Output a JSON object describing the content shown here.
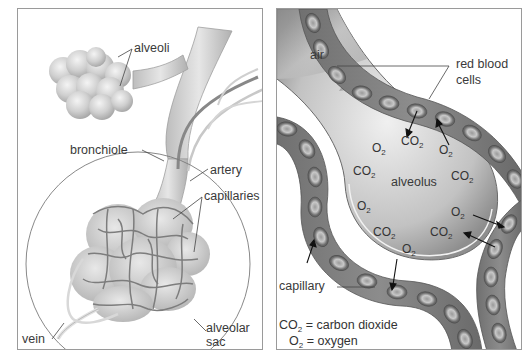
{
  "left_panel": {
    "labels": {
      "alveoli": "alveoli",
      "bronchiole": "bronchiole",
      "artery": "artery",
      "capillaries": "capillaries",
      "vein": "vein",
      "alveolar_sac_1": "alveolar",
      "alveolar_sac_2": "sac"
    }
  },
  "right_panel": {
    "labels": {
      "air": "air",
      "red_blood_cells_1": "red blood",
      "red_blood_cells_2": "cells",
      "alveolus": "alveolus",
      "capillary": "capillary"
    },
    "molecules": [
      {
        "base": "O",
        "sub": "2"
      },
      {
        "base": "CO",
        "sub": "2"
      },
      {
        "base": "O",
        "sub": "2"
      },
      {
        "base": "CO",
        "sub": "2"
      },
      {
        "base": "CO",
        "sub": "2"
      },
      {
        "base": "O",
        "sub": "2"
      },
      {
        "base": "O",
        "sub": "2"
      },
      {
        "base": "CO",
        "sub": "2"
      },
      {
        "base": "CO",
        "sub": "2"
      },
      {
        "base": "O",
        "sub": "2"
      }
    ],
    "legend": {
      "co2_base": "CO",
      "co2_sub": "2",
      "co2_text": " = carbon dioxide",
      "o2_base": "O",
      "o2_sub": "2",
      "o2_text": " = oxygen"
    }
  },
  "colors": {
    "border": "#9a9a9a",
    "tissue_light": "#d8d8d8",
    "tissue_mid": "#a8a8a8",
    "tissue_dark": "#6a6a6a",
    "text": "#333333"
  }
}
